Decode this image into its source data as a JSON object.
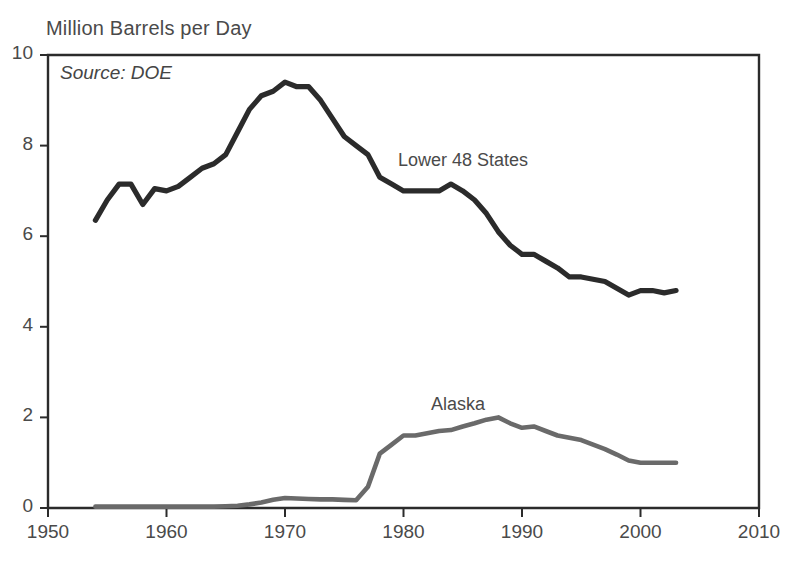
{
  "chart_data": {
    "type": "line",
    "title": "Million Barrels per Day",
    "xlabel": "",
    "ylabel": "",
    "annotation": "Source: DOE",
    "grid": false,
    "legend_position": "inline-labels",
    "xlim": [
      1950,
      2010
    ],
    "ylim": [
      0,
      10
    ],
    "xticks": [
      1950,
      1960,
      1970,
      1980,
      1990,
      2000,
      2010
    ],
    "xtick_labels": [
      "1950",
      "1960",
      "1970",
      "1980",
      "1990",
      "2000",
      "2010"
    ],
    "yticks": [
      0,
      2,
      4,
      6,
      8,
      10
    ],
    "ytick_labels": [
      "0",
      "2",
      "4",
      "6",
      "8",
      "10"
    ],
    "colors": {
      "lower48": "#2b2b2b",
      "alaska": "#6a6a6a",
      "axis": "#2b2b2b",
      "text": "#4a4a4a"
    },
    "series": [
      {
        "name": "Lower 48 States",
        "color": "#2b2b2b",
        "label_x": 1979.5,
        "label_y": 8.15,
        "x": [
          1954,
          1955,
          1956,
          1957,
          1958,
          1959,
          1960,
          1961,
          1962,
          1963,
          1964,
          1965,
          1966,
          1967,
          1968,
          1969,
          1970,
          1971,
          1972,
          1973,
          1974,
          1975,
          1976,
          1977,
          1978,
          1979,
          1980,
          1981,
          1982,
          1983,
          1984,
          1985,
          1986,
          1987,
          1988,
          1989,
          1990,
          1991,
          1992,
          1993,
          1994,
          1995,
          1996,
          1997,
          1998,
          1999,
          2000,
          2001,
          2002,
          2003
        ],
        "values": [
          6.35,
          6.8,
          7.15,
          7.15,
          6.7,
          7.05,
          7.0,
          7.1,
          7.3,
          7.5,
          7.6,
          7.8,
          8.3,
          8.8,
          9.1,
          9.2,
          9.4,
          9.3,
          9.3,
          9.0,
          8.6,
          8.2,
          8.0,
          7.8,
          7.3,
          7.15,
          7.0,
          7.0,
          7.0,
          7.0,
          7.15,
          7.0,
          6.8,
          6.5,
          6.1,
          5.8,
          5.6,
          5.6,
          5.45,
          5.3,
          5.1,
          5.1,
          5.05,
          5.0,
          4.85,
          4.7,
          4.8,
          4.8,
          4.75,
          4.8
        ]
      },
      {
        "name": "Alaska",
        "color": "#6a6a6a",
        "label_x": 1982.5,
        "label_y": 2.45,
        "x": [
          1954,
          1955,
          1956,
          1957,
          1958,
          1959,
          1960,
          1961,
          1962,
          1963,
          1964,
          1965,
          1966,
          1967,
          1968,
          1969,
          1970,
          1971,
          1972,
          1973,
          1974,
          1975,
          1976,
          1977,
          1978,
          1979,
          1980,
          1981,
          1982,
          1983,
          1984,
          1985,
          1986,
          1987,
          1988,
          1989,
          1990,
          1991,
          1992,
          1993,
          1994,
          1995,
          1996,
          1997,
          1998,
          1999,
          2000,
          2001,
          2002,
          2003
        ],
        "values": [
          0.03,
          0.03,
          0.03,
          0.03,
          0.03,
          0.03,
          0.03,
          0.03,
          0.03,
          0.03,
          0.03,
          0.04,
          0.05,
          0.08,
          0.12,
          0.18,
          0.22,
          0.21,
          0.2,
          0.19,
          0.19,
          0.18,
          0.17,
          0.47,
          1.2,
          1.4,
          1.6,
          1.6,
          1.65,
          1.7,
          1.72,
          1.8,
          1.87,
          1.95,
          2.0,
          1.87,
          1.77,
          1.8,
          1.7,
          1.6,
          1.55,
          1.5,
          1.4,
          1.3,
          1.18,
          1.05,
          1.0,
          1.0,
          1.0,
          1.0
        ]
      }
    ]
  },
  "plot_geometry": {
    "left": 48,
    "right": 759,
    "top": 55,
    "bottom": 508
  }
}
